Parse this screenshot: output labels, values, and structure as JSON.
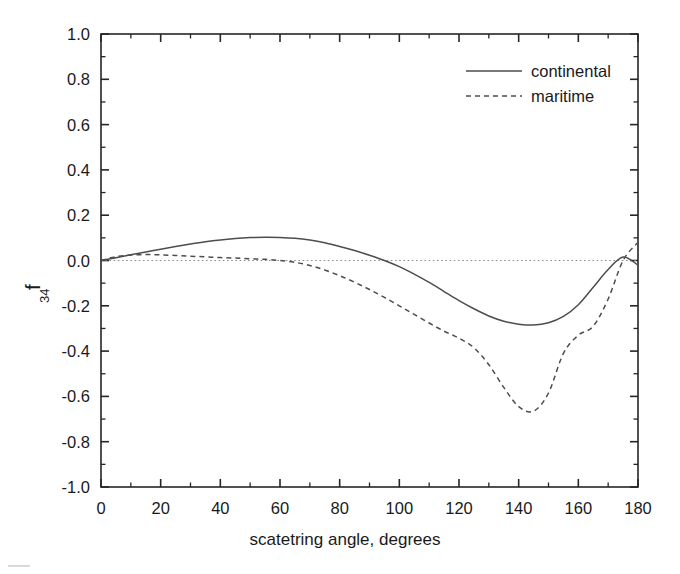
{
  "figure": {
    "background": "#ffffff",
    "axis_color": "#262626",
    "series_color": "#4d4d4d",
    "zero_line_color": "#8c8c8c"
  },
  "chart_data": {
    "type": "line",
    "title": "",
    "xlabel": "scatetring angle, degrees",
    "ylabel": "f_34",
    "ylabel_base": "f",
    "ylabel_subscript": "34",
    "xlim": [
      0,
      180
    ],
    "ylim": [
      -1.0,
      1.0
    ],
    "xticks": [
      0,
      20,
      40,
      60,
      80,
      100,
      120,
      140,
      160,
      180
    ],
    "xtick_labels": [
      "0",
      "20",
      "40",
      "60",
      "80",
      "100",
      "120",
      "140",
      "160",
      "180"
    ],
    "x_minor_step": 10,
    "yticks": [
      -1.0,
      -0.8,
      -0.6,
      -0.4,
      -0.2,
      0.0,
      0.2,
      0.4,
      0.6,
      0.8,
      1.0
    ],
    "ytick_labels": [
      "-1.0",
      "-0.8",
      "-0.6",
      "-0.4",
      "-0.2",
      "0.0",
      "0.2",
      "0.4",
      "0.6",
      "0.8",
      "1.0"
    ],
    "y_minor_step": 0.1,
    "grid": false,
    "legend_position": "top-right",
    "reference_lines": [
      {
        "name": "zero-line",
        "orientation": "horizontal",
        "value": 0.0,
        "style": "dotted"
      }
    ],
    "series": [
      {
        "name": "continental",
        "style": "solid",
        "x": [
          0,
          5,
          10,
          15,
          20,
          25,
          30,
          35,
          40,
          45,
          50,
          55,
          60,
          65,
          70,
          75,
          80,
          85,
          90,
          95,
          100,
          105,
          110,
          115,
          120,
          125,
          130,
          135,
          140,
          145,
          150,
          155,
          160,
          165,
          170,
          175,
          180
        ],
        "values": [
          0.0,
          0.012,
          0.025,
          0.038,
          0.05,
          0.062,
          0.073,
          0.083,
          0.091,
          0.097,
          0.101,
          0.103,
          0.102,
          0.098,
          0.09,
          0.078,
          0.062,
          0.044,
          0.023,
          0.0,
          -0.027,
          -0.06,
          -0.097,
          -0.137,
          -0.177,
          -0.213,
          -0.245,
          -0.268,
          -0.281,
          -0.285,
          -0.275,
          -0.247,
          -0.195,
          -0.118,
          -0.04,
          0.015,
          -0.02
        ]
      },
      {
        "name": "maritime",
        "style": "dashed",
        "x": [
          0,
          5,
          10,
          15,
          20,
          25,
          30,
          35,
          40,
          45,
          50,
          55,
          60,
          65,
          70,
          75,
          80,
          85,
          90,
          95,
          100,
          105,
          110,
          115,
          120,
          125,
          130,
          135,
          140,
          145,
          150,
          155,
          160,
          165,
          170,
          175,
          180
        ],
        "values": [
          0.0,
          0.017,
          0.024,
          0.026,
          0.025,
          0.022,
          0.019,
          0.016,
          0.013,
          0.011,
          0.008,
          0.005,
          0.0,
          -0.008,
          -0.022,
          -0.042,
          -0.067,
          -0.096,
          -0.128,
          -0.163,
          -0.2,
          -0.238,
          -0.276,
          -0.312,
          -0.343,
          -0.385,
          -0.46,
          -0.56,
          -0.645,
          -0.665,
          -0.585,
          -0.41,
          -0.33,
          -0.29,
          -0.17,
          0.0,
          0.08
        ]
      }
    ],
    "legend": [
      {
        "label": "continental",
        "style": "solid"
      },
      {
        "label": "maritime",
        "style": "dashed"
      }
    ]
  }
}
